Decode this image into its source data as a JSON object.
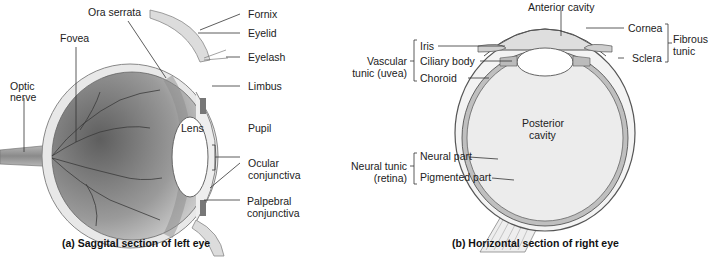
{
  "panel_a": {
    "caption": "(a) Saggital section of left eye",
    "labels": {
      "ora_serrata": "Ora serrata",
      "fovea": "Fovea",
      "optic_nerve_1": "Optic",
      "optic_nerve_2": "nerve",
      "fornix": "Fornix",
      "eyelid": "Eyelid",
      "eyelash": "Eyelash",
      "limbus": "Limbus",
      "lens": "Lens",
      "pupil": "Pupil",
      "ocular_conjunctiva_1": "Ocular",
      "ocular_conjunctiva_2": "conjunctiva",
      "palpebral_conjunctiva_1": "Palpebral",
      "palpebral_conjunctiva_2": "conjunctiva"
    }
  },
  "panel_b": {
    "caption": "(b) Horizontal section of right eye",
    "labels": {
      "anterior_cavity": "Anterior cavity",
      "cornea": "Cornea",
      "sclera": "Sclera",
      "fibrous_tunic_1": "Fibrous",
      "fibrous_tunic_2": "tunic",
      "iris": "Iris",
      "ciliary_body": "Ciliary body",
      "choroid": "Choroid",
      "vascular_tunic_1": "Vascular",
      "vascular_tunic_2": "tunic (uvea)",
      "posterior_cavity_1": "Posterior",
      "posterior_cavity_2": "cavity",
      "neural_part": "Neural part",
      "pigmented_part": "Pigmented part",
      "neural_tunic_1": "Neural tunic",
      "neural_tunic_2": "(retina)"
    }
  },
  "colors": {
    "eyeball_dark": "#6e6e6e",
    "eyeball_light": "#d9d9d9",
    "cavity_fill": "#e6e6e6",
    "wall": "#bdbdbd",
    "line": "#333333"
  }
}
